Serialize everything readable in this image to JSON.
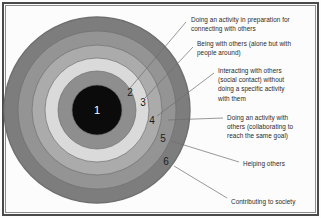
{
  "figure": {
    "type": "concentric-circles-diagram",
    "background_color": "#fdfdfd",
    "frame_color": "#4a4a4a"
  },
  "circle": {
    "center_x": 97,
    "center_y": 110,
    "outer_radius": 93,
    "rings": [
      {
        "number": "1",
        "label": "",
        "radius": 25,
        "fill": "#0b0b0b",
        "number_color": "#ffffff",
        "number_x": 97,
        "number_y": 110
      },
      {
        "number": "2",
        "label": "Doing an activity in preparation for\nconnecting with others",
        "radius": 39,
        "fill": "#8e8e8e",
        "number_color": "#1c1c1c",
        "number_x": 130,
        "number_y": 93
      },
      {
        "number": "3",
        "label": "Being with others (alone but with\npeople around)",
        "radius": 52,
        "fill": "#dadada",
        "number_color": "#1c1c1c",
        "number_y": 103,
        "number_x": 143
      },
      {
        "number": "4",
        "label": "Interacting with others\n(social contact) without\ndoing a specific activity\nwith them",
        "radius": 65,
        "fill": "#ababab",
        "number_color": "#1c1c1c",
        "number_x": 152,
        "number_y": 121
      },
      {
        "number": "5",
        "label": "Doing an activity with\nothers (collaborating to\nreach the same goal)",
        "radius": 79,
        "fill": "#949494",
        "number_color": "#1c1c1c",
        "number_x": 163,
        "number_y": 139
      },
      {
        "number": "6",
        "label": "Helping others",
        "radius": 93,
        "fill": "#7d7d7d",
        "number_color": "#1c1c1c",
        "number_x": 166,
        "number_y": 162
      }
    ],
    "outer_label": "Contributing to society"
  },
  "callouts": [
    {
      "id": "callout-1",
      "text": "Doing an activity in preparation for\nconnecting with others",
      "x": 191,
      "y": 15,
      "leader": {
        "x1": 186,
        "y1": 22,
        "x2": 130,
        "y2": 88
      }
    },
    {
      "id": "callout-2",
      "text": "Being with others (alone but with\npeople around)",
      "x": 197,
      "y": 39,
      "leader": {
        "x1": 193,
        "y1": 47,
        "x2": 145,
        "y2": 98
      }
    },
    {
      "id": "callout-3",
      "text": "Interacting with others\n(social contact) without\ndoing a specific activity\nwith them",
      "x": 218,
      "y": 66,
      "leader": {
        "x1": 214,
        "y1": 73,
        "x2": 157,
        "y2": 116
      }
    },
    {
      "id": "callout-4",
      "text": "Doing an activity with\nothers (collaborating to\nreach the same goal)",
      "x": 227,
      "y": 113,
      "leader": {
        "x1": 223,
        "y1": 118,
        "x2": 168,
        "y2": 120
      }
    },
    {
      "id": "callout-5",
      "text": "Helping others",
      "x": 243,
      "y": 159,
      "leader": {
        "x1": 239,
        "y1": 162,
        "x2": 171,
        "y2": 141
      }
    },
    {
      "id": "callout-6",
      "text": "Contributing to society",
      "x": 231,
      "y": 197,
      "leader": {
        "x1": 227,
        "y1": 198,
        "x2": 174,
        "y2": 166
      }
    }
  ],
  "style": {
    "leader_color": "#6d6d6d",
    "text_color": "#2b2b2b",
    "ring_stroke": "#6f6f6f"
  }
}
